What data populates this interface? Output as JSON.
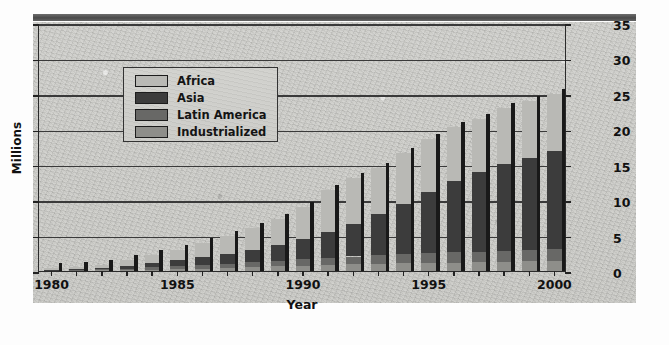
{
  "figure": {
    "background_color": "#cfcfcb",
    "frame_color": "#2b2b2b"
  },
  "legend": {
    "position": "upper-left-inside",
    "entries": [
      {
        "label": "Africa",
        "color": "#b9b9b5"
      },
      {
        "label": "Asia",
        "color": "#3c3c3c"
      },
      {
        "label": "Latin America",
        "color": "#686866"
      },
      {
        "label": "Industrialized",
        "color": "#8e8e8a"
      }
    ]
  },
  "axes": {
    "y_title": "Millions",
    "x_title": "Year",
    "y_ticks": [
      "0",
      "5",
      "10",
      "15",
      "20",
      "25",
      "30",
      "35"
    ],
    "y_ticks_right": [
      "0",
      "5",
      "10",
      "15",
      "20",
      "25",
      "30",
      "35"
    ],
    "x_ticks": [
      "1980",
      "1985",
      "1990",
      "1995",
      "2000"
    ]
  },
  "chart_data": {
    "type": "bar",
    "title": "",
    "subtitle": "",
    "xlabel": "Year",
    "ylabel": "Millions",
    "ylim": [
      0,
      35
    ],
    "xlim": [
      1980,
      2000
    ],
    "grid": true,
    "stacked": true,
    "legend_position": "upper left (inside plot)",
    "annotations": [],
    "categories": [
      "1980",
      "1981",
      "1982",
      "1983",
      "1984",
      "1985",
      "1986",
      "1987",
      "1988",
      "1989",
      "1990",
      "1991",
      "1992",
      "1993",
      "1994",
      "1995",
      "1996",
      "1997",
      "1998",
      "1999",
      "2000"
    ],
    "series": [
      {
        "name": "Industrialized",
        "color": "#8e8e8a",
        "values": [
          0.05,
          0.07,
          0.1,
          0.15,
          0.2,
          0.25,
          0.35,
          0.45,
          0.55,
          0.65,
          0.75,
          0.85,
          0.95,
          1.05,
          1.1,
          1.15,
          1.2,
          1.25,
          1.3,
          1.35,
          1.4
        ]
      },
      {
        "name": "Latin America",
        "color": "#686866",
        "values": [
          0.05,
          0.08,
          0.12,
          0.2,
          0.3,
          0.4,
          0.5,
          0.6,
          0.7,
          0.8,
          0.9,
          1.0,
          1.1,
          1.2,
          1.3,
          1.4,
          1.45,
          1.5,
          1.55,
          1.6,
          1.65
        ]
      },
      {
        "name": "Asia",
        "color": "#3c3c3c",
        "values": [
          0.1,
          0.15,
          0.25,
          0.4,
          0.6,
          0.85,
          1.1,
          1.4,
          1.75,
          2.2,
          2.85,
          3.6,
          4.6,
          5.8,
          7.1,
          8.6,
          10.05,
          11.25,
          12.3,
          13.05,
          13.95
        ]
      },
      {
        "name": "Africa",
        "color": "#b9b9b5",
        "values": [
          0.2,
          0.3,
          0.43,
          0.75,
          1.1,
          1.4,
          1.95,
          2.55,
          3.1,
          3.65,
          4.5,
          6.05,
          6.45,
          6.55,
          7.1,
          7.45,
          7.6,
          7.5,
          7.85,
          8.0,
          8.0
        ]
      }
    ],
    "totals": [
      0.4,
      0.6,
      0.9,
      1.5,
      2.2,
      2.9,
      3.9,
      5.0,
      6.1,
      7.3,
      9.0,
      11.5,
      13.1,
      14.6,
      16.6,
      18.6,
      20.3,
      21.5,
      23.0,
      24.0,
      25.0
    ]
  }
}
